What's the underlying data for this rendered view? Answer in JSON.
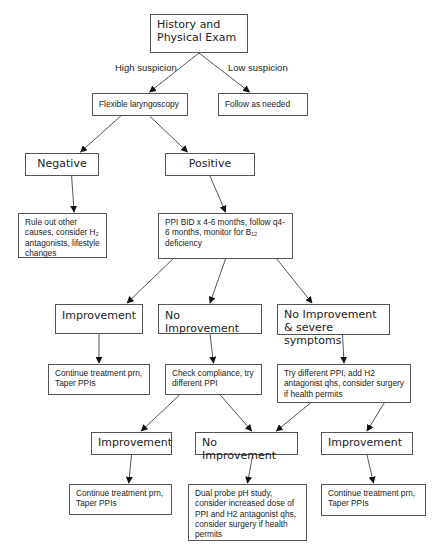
{
  "nodes": {
    "history": "History and Physical Exam",
    "laryngoscopy": "Flexible laryngoscopy",
    "follow": "Follow as needed",
    "negative": "Negative",
    "positive": "Positive",
    "rule_out": "Rule out other causes, consider H₂ antagonists, lifestyle changes",
    "ppi": "PPI BID x 4-6 months, follow q4-6 months, monitor for B₁₂ deficiency",
    "improvement_1": "Improvement",
    "no_improvement_1": "No Improvement",
    "no_improvement_severe": "No Improvement & severe symptoms",
    "continue_1": "Continue treatment prn, Taper PPIs",
    "check_compliance": "Check compliance, try different PPI",
    "try_different": "Try different PPI, add H2 antagonist qhs, consider surgery if health permits",
    "improvement_2": "Improvement",
    "no_improvement_2": "No Improvement",
    "improvement_3": "Improvement",
    "continue_2": "Continue treatment prn, Taper PPIs",
    "dual_probe": "Dual probe pH study, consider increased dose of PPI and H2 antagonist qhs, consider surgery if health permits",
    "continue_3": "Continue treatment prn, Taper PPIs"
  },
  "edge_labels": {
    "high": "High suspicion",
    "low": "Low suspicion"
  },
  "edges": [
    [
      "history",
      "laryngoscopy"
    ],
    [
      "history",
      "follow"
    ],
    [
      "laryngoscopy",
      "negative"
    ],
    [
      "laryngoscopy",
      "positive"
    ],
    [
      "negative",
      "rule_out"
    ],
    [
      "positive",
      "ppi"
    ],
    [
      "ppi",
      "improvement_1"
    ],
    [
      "ppi",
      "no_improvement_1"
    ],
    [
      "ppi",
      "no_improvement_severe"
    ],
    [
      "improvement_1",
      "continue_1"
    ],
    [
      "no_improvement_1",
      "check_compliance"
    ],
    [
      "no_improvement_severe",
      "try_different"
    ],
    [
      "check_compliance",
      "improvement_2"
    ],
    [
      "check_compliance",
      "no_improvement_2"
    ],
    [
      "try_different",
      "no_improvement_2"
    ],
    [
      "try_different",
      "improvement_3"
    ],
    [
      "improvement_2",
      "continue_2"
    ],
    [
      "no_improvement_2",
      "dual_probe"
    ],
    [
      "improvement_3",
      "continue_3"
    ]
  ]
}
